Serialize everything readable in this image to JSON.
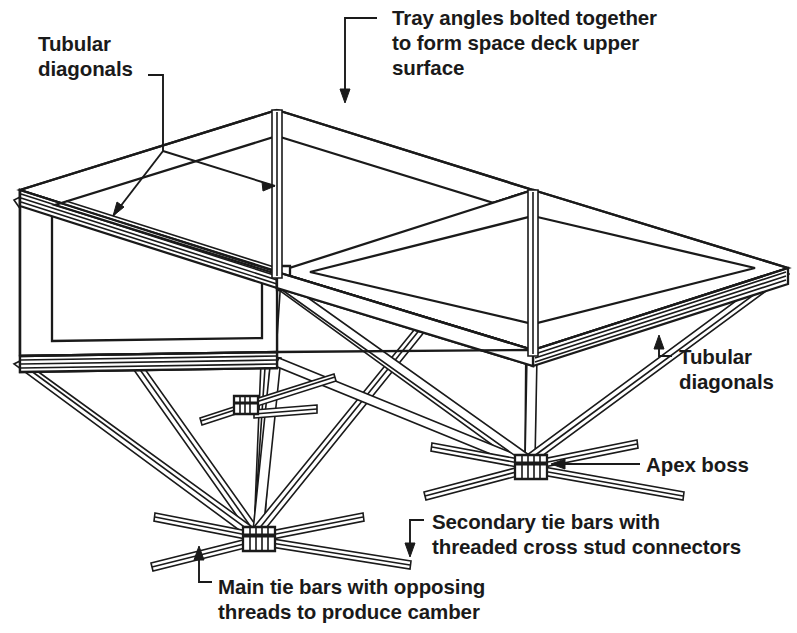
{
  "figure": {
    "kind": "isometric-engineering-diagram",
    "background_color": "#ffffff",
    "line_color": "#1a1a1a"
  },
  "labels": {
    "tubular_top_left": "Tubular\ndiagonals",
    "tray_angles": "Tray angles bolted together\nto form space deck upper\nsurface",
    "tubular_bottom_right": "Tubular\ndiagonals",
    "apex_boss": "Apex boss",
    "secondary_tie_bars": "Secondary tie bars with\nthreaded cross stud connectors",
    "main_tie_bars": "Main tie bars with opposing\nthreads to produce camber"
  },
  "callouts": [
    {
      "name": "tubular-diagonals-top-left",
      "text": "Tubular diagonals",
      "arrow": "right-and-down",
      "targets": 2
    },
    {
      "name": "tray-angles",
      "text": "Tray angles bolted together to form space deck upper surface",
      "arrow": "down",
      "targets": 1
    },
    {
      "name": "tubular-diagonals-bottom-right",
      "text": "Tubular diagonals",
      "arrow": "up-left",
      "targets": 1
    },
    {
      "name": "apex-boss",
      "text": "Apex boss",
      "arrow": "left",
      "targets": 1
    },
    {
      "name": "secondary-tie-bars",
      "text": "Secondary tie bars with threaded cross stud connectors",
      "arrow": "down-left",
      "targets": 1
    },
    {
      "name": "main-tie-bars",
      "text": "Main tie bars with opposing threads to produce camber",
      "arrow": "up",
      "targets": 1
    }
  ],
  "geometry": {
    "deck_nodes": [
      {
        "id": "A",
        "x": 277,
        "y": 110
      },
      {
        "id": "B",
        "x": 533,
        "y": 190
      },
      {
        "id": "C",
        "x": 20,
        "y": 190
      },
      {
        "id": "D",
        "x": 277,
        "y": 272
      },
      {
        "id": "E",
        "x": 788,
        "y": 268
      },
      {
        "id": "F",
        "x": 20,
        "y": 356
      },
      {
        "id": "G",
        "x": 277,
        "y": 352
      },
      {
        "id": "H",
        "x": 533,
        "y": 350
      }
    ],
    "apex_bosses": [
      {
        "id": "apex-left",
        "x": 258,
        "y": 536
      },
      {
        "id": "apex-right",
        "x": 530,
        "y": 464
      }
    ],
    "secondary_node": {
      "x": 247,
      "y": 404
    },
    "tray_count": 4,
    "tie_bars_per_boss": 6
  }
}
